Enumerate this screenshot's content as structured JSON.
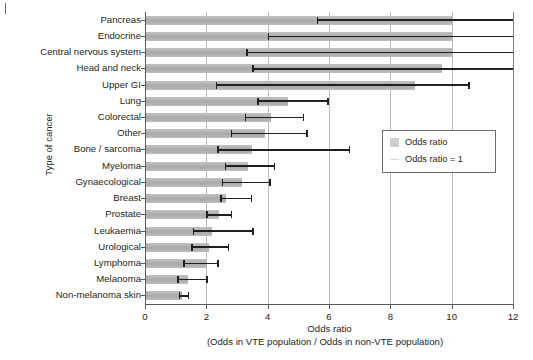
{
  "figure": {
    "yaxis_title": "Type of cancer",
    "xaxis_title": "Odds ratio",
    "xaxis_subtitle": "(Odds in VTE population / Odds in non-VTE population)"
  },
  "legend": {
    "items": [
      {
        "label": "Odds ratio",
        "marker": "gray-swatch"
      },
      {
        "label": "Odds ratio = 1",
        "marker": "reference-line"
      }
    ]
  },
  "axis": {
    "ticks": [
      "0",
      "2",
      "4",
      "6",
      "8",
      "10",
      "12"
    ],
    "tick_values": [
      0,
      2,
      4,
      6,
      8,
      10,
      12
    ]
  },
  "chart_data": {
    "type": "bar",
    "orientation": "horizontal",
    "title": "",
    "xlabel": "Odds ratio (Odds in VTE population / Odds in non-VTE population)",
    "ylabel": "Type of cancer",
    "xlim": [
      0,
      12
    ],
    "grid": true,
    "grid_axis": "x",
    "legend_position": "center-right",
    "reference_line": 1,
    "categories": [
      "Pancreas",
      "Endocrine",
      "Central nervous system",
      "Head and neck",
      "Upper GI",
      "Lung",
      "Colorectal",
      "Other",
      "Bone / sarcoma",
      "Myeloma",
      "Gynaecological",
      "Breast",
      "Prostate",
      "Leukaemia",
      "Urological",
      "Lymphoma",
      "Melanoma",
      "Non-melanoma skin"
    ],
    "values": [
      10.0,
      10.0,
      10.0,
      9.7,
      8.8,
      4.65,
      4.1,
      3.9,
      3.5,
      3.35,
      3.15,
      2.65,
      2.4,
      2.2,
      2.1,
      2.0,
      1.4,
      1.2
    ],
    "error_low": [
      5.6,
      4.0,
      3.3,
      3.5,
      2.3,
      3.65,
      3.25,
      2.8,
      2.35,
      2.6,
      2.5,
      2.45,
      2.0,
      1.55,
      1.5,
      1.25,
      1.05,
      1.1
    ],
    "error_high": [
      12.0,
      12.0,
      12.0,
      12.0,
      10.6,
      6.0,
      5.2,
      5.3,
      6.7,
      4.25,
      4.1,
      3.5,
      2.85,
      3.55,
      2.75,
      2.4,
      2.05,
      1.45
    ],
    "series": [
      {
        "name": "Odds ratio",
        "values": [
          10.0,
          10.0,
          10.0,
          9.7,
          8.8,
          4.65,
          4.1,
          3.9,
          3.5,
          3.35,
          3.15,
          2.65,
          2.4,
          2.2,
          2.1,
          2.0,
          1.4,
          1.2
        ]
      }
    ],
    "colors": {
      "bar": "#b0b0b0",
      "error": "#231f20",
      "grid": "#b9babc",
      "axis": "#58595b"
    }
  }
}
